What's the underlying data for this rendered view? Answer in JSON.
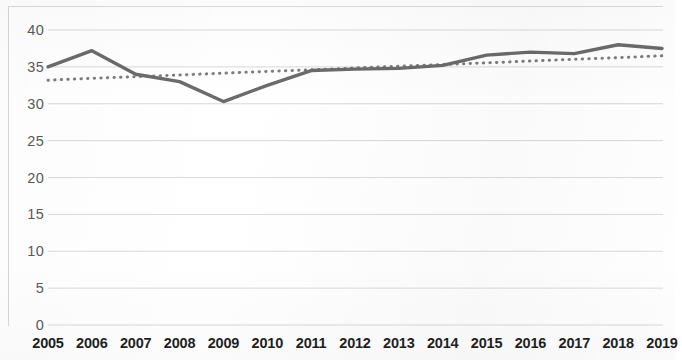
{
  "chart_data": {
    "type": "line",
    "title": "",
    "subtitle": "",
    "xlabel": "",
    "ylabel": "",
    "categories": [
      "2005",
      "2006",
      "2007",
      "2008",
      "2009",
      "2010",
      "2011",
      "2012",
      "2013",
      "2014",
      "2015",
      "2016",
      "2017",
      "2018",
      "2019"
    ],
    "x": [
      2005,
      2006,
      2007,
      2008,
      2009,
      2010,
      2011,
      2012,
      2013,
      2014,
      2015,
      2016,
      2017,
      2018,
      2019
    ],
    "series": [
      {
        "name": "data-series",
        "style": "solid",
        "color": "#6b6b6b",
        "values": [
          35.0,
          37.2,
          34.0,
          33.0,
          30.3,
          32.5,
          34.5,
          34.7,
          34.8,
          35.2,
          36.6,
          37.0,
          36.8,
          38.0,
          37.5
        ]
      },
      {
        "name": "linear-trendline",
        "style": "dotted",
        "color": "#7d7d7d",
        "values": [
          33.2,
          33.44,
          33.67,
          33.91,
          34.14,
          34.38,
          34.61,
          34.85,
          35.08,
          35.32,
          35.55,
          35.79,
          36.02,
          36.26,
          36.5
        ]
      }
    ],
    "ylim": [
      0,
      40
    ],
    "yticks": [
      0,
      5,
      10,
      15,
      20,
      25,
      30,
      35,
      40
    ],
    "ytick_labels": [
      "0",
      "5",
      "10",
      "15",
      "20",
      "25",
      "30",
      "35",
      "40"
    ],
    "xtick_labels": [
      "2005",
      "2006",
      "2007",
      "2008",
      "2009",
      "2010",
      "2011",
      "2012",
      "2013",
      "2014",
      "2015",
      "2016",
      "2017",
      "2018",
      "2019"
    ],
    "grid": true,
    "grid_axis": "y",
    "grid_color": "#d9d9d9",
    "legend": false,
    "legend_position": "none",
    "plot_background": "#ffffff",
    "annotations": []
  },
  "axes": {
    "y_ticks": [
      "40",
      "35",
      "30",
      "25",
      "20",
      "15",
      "10",
      "5",
      "0"
    ],
    "x_ticks": [
      "2005",
      "2006",
      "2007",
      "2008",
      "2009",
      "2010",
      "2011",
      "2012",
      "2013",
      "2014",
      "2015",
      "2016",
      "2017",
      "2018",
      "2019"
    ]
  }
}
